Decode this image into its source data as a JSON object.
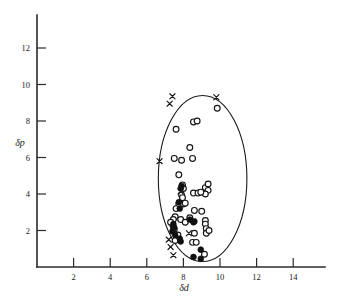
{
  "figure": {
    "background_color": "#ffffff",
    "ink_color": "#1a1a1a"
  },
  "chart_data": {
    "type": "scatter",
    "title": "",
    "subtitle": "",
    "xlabel": "δd",
    "ylabel": "δp",
    "xlim": [
      0,
      15.6
    ],
    "ylim": [
      0,
      13.2
    ],
    "xticks": [
      2,
      4,
      6,
      8,
      10,
      12,
      14
    ],
    "yticks": [
      2,
      4,
      6,
      8,
      10,
      12
    ],
    "xtick_labels": [
      "2",
      "4",
      "6",
      "8",
      "10",
      "12",
      "14"
    ],
    "ytick_labels": [
      "2",
      "4",
      "6",
      "8",
      "10",
      "12"
    ],
    "grid": false,
    "legend": null,
    "legend_position": "none",
    "annotations": [
      {
        "kind": "ellipse",
        "name": "solubility-envelope",
        "center_x": 9.05,
        "center_y": 4.85,
        "radius_x": 2.42,
        "radius_y": 4.55,
        "rotation_deg": 0
      }
    ],
    "series": [
      {
        "name": "open-circle",
        "marker": "o",
        "filled": false,
        "count": 46,
        "points": [
          [
            9.85,
            8.7
          ],
          [
            8.55,
            7.95
          ],
          [
            8.75,
            8.0
          ],
          [
            7.6,
            7.55
          ],
          [
            8.35,
            6.55
          ],
          [
            7.5,
            5.95
          ],
          [
            8.5,
            5.95
          ],
          [
            7.9,
            5.85
          ],
          [
            7.75,
            5.05
          ],
          [
            7.95,
            4.5
          ],
          [
            8.0,
            4.3
          ],
          [
            9.2,
            4.35
          ],
          [
            9.35,
            4.2
          ],
          [
            8.55,
            4.05
          ],
          [
            8.8,
            4.05
          ],
          [
            9.2,
            4.0
          ],
          [
            7.9,
            3.95
          ],
          [
            7.95,
            3.8
          ],
          [
            7.75,
            3.45
          ],
          [
            8.0,
            3.45
          ],
          [
            7.6,
            3.2
          ],
          [
            8.6,
            3.1
          ],
          [
            9.0,
            3.05
          ],
          [
            7.55,
            2.75
          ],
          [
            7.45,
            2.6
          ],
          [
            7.85,
            2.6
          ],
          [
            8.35,
            2.7
          ],
          [
            9.2,
            2.55
          ],
          [
            7.4,
            2.35
          ],
          [
            7.45,
            2.2
          ],
          [
            9.2,
            2.35
          ],
          [
            9.25,
            2.1
          ],
          [
            9.25,
            1.85
          ],
          [
            7.5,
            2.05
          ],
          [
            8.6,
            1.85
          ],
          [
            7.55,
            1.45
          ],
          [
            8.5,
            1.35
          ],
          [
            8.7,
            1.35
          ],
          [
            9.15,
            0.7
          ],
          [
            7.7,
            1.75
          ],
          [
            8.1,
            2.45
          ],
          [
            9.35,
            4.55
          ],
          [
            7.3,
            2.45
          ],
          [
            8.1,
            3.5
          ],
          [
            9.4,
            2.0
          ],
          [
            8.95,
            4.1
          ]
        ]
      },
      {
        "name": "filled-circle",
        "marker": "o",
        "filled": true,
        "count": 16,
        "points": [
          [
            7.9,
            4.45
          ],
          [
            7.85,
            4.3
          ],
          [
            7.75,
            3.55
          ],
          [
            7.8,
            3.2
          ],
          [
            8.35,
            2.6
          ],
          [
            8.6,
            2.5
          ],
          [
            8.55,
            2.45
          ],
          [
            7.45,
            2.35
          ],
          [
            7.5,
            2.15
          ],
          [
            7.4,
            1.95
          ],
          [
            7.55,
            1.75
          ],
          [
            7.8,
            1.55
          ],
          [
            7.85,
            1.4
          ],
          [
            8.95,
            0.95
          ],
          [
            8.55,
            0.55
          ],
          [
            8.95,
            0.45
          ]
        ]
      },
      {
        "name": "cross",
        "marker": "x",
        "filled": false,
        "count": 10,
        "points": [
          [
            7.4,
            9.35
          ],
          [
            7.25,
            8.95
          ],
          [
            9.8,
            9.3
          ],
          [
            6.7,
            5.8
          ],
          [
            7.85,
            4.15
          ],
          [
            8.3,
            1.85
          ],
          [
            7.2,
            1.5
          ],
          [
            7.3,
            1.1
          ],
          [
            7.45,
            0.65
          ],
          [
            7.5,
            2.0
          ]
        ]
      }
    ]
  }
}
